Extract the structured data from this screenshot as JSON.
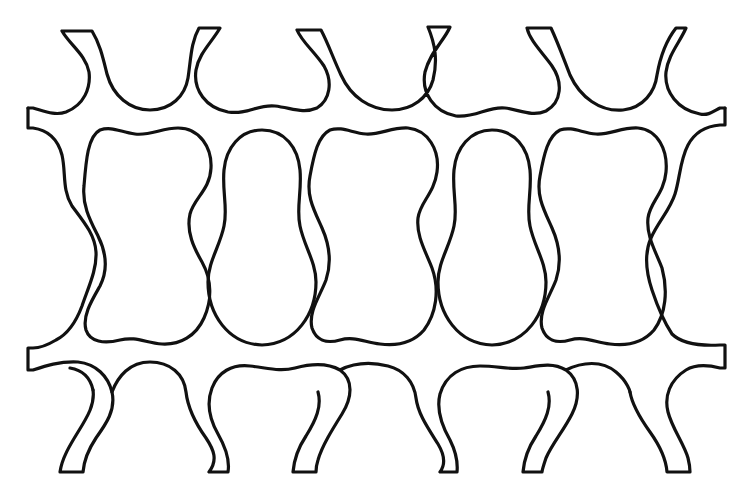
{
  "figure": {
    "type": "line-drawing",
    "stroke_color": "#111111",
    "background_color": "#ffffff",
    "cells_in_middle_row": 5,
    "top_prongs": 6,
    "bottom_prongs": 6,
    "side_tabs": 4
  }
}
